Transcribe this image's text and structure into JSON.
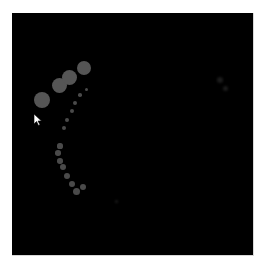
{
  "scene": {
    "background": "#000000",
    "dot_color": "#555555",
    "large_circles": [
      {
        "x": 42,
        "y": 100,
        "r": 8
      },
      {
        "x": 59,
        "y": 85,
        "r": 7.5
      },
      {
        "x": 69,
        "y": 77,
        "r": 7.5
      },
      {
        "x": 84,
        "y": 68,
        "r": 7
      }
    ],
    "small_dots": [
      {
        "x": 86,
        "y": 89,
        "r": 1.5
      },
      {
        "x": 80,
        "y": 95,
        "r": 1.8
      },
      {
        "x": 75,
        "y": 103,
        "r": 2
      },
      {
        "x": 72,
        "y": 111,
        "r": 2.2
      },
      {
        "x": 67,
        "y": 120,
        "r": 2.2
      },
      {
        "x": 64,
        "y": 128,
        "r": 2.4
      },
      {
        "x": 60,
        "y": 146,
        "r": 2.6
      },
      {
        "x": 58,
        "y": 153,
        "r": 2.8
      },
      {
        "x": 60,
        "y": 161,
        "r": 2.8
      },
      {
        "x": 63,
        "y": 167,
        "r": 3
      },
      {
        "x": 67,
        "y": 176,
        "r": 3.2
      },
      {
        "x": 72,
        "y": 184,
        "r": 3.4
      },
      {
        "x": 76,
        "y": 191,
        "r": 3.5
      },
      {
        "x": 83,
        "y": 187,
        "r": 3
      }
    ],
    "faint_marks": [
      {
        "x": 220,
        "y": 80,
        "r": 3
      },
      {
        "x": 225,
        "y": 88,
        "r": 2.5
      },
      {
        "x": 116,
        "y": 201,
        "r": 1.5
      }
    ],
    "cursor": {
      "x": 34,
      "y": 114
    }
  }
}
